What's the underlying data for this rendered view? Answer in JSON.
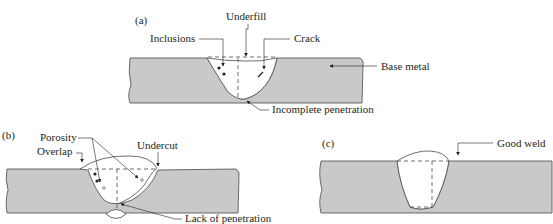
{
  "figure": {
    "colors": {
      "base_metal": "#c9c9c9",
      "outline": "#4a4a4a",
      "weld": "#ffffff",
      "text": "#231f20"
    },
    "panel_a": {
      "tag": "(a)",
      "labels": {
        "underfill": "Underfill",
        "inclusions": "Inclusions",
        "crack": "Crack",
        "base_metal": "Base metal",
        "incomplete_penetration": "Incomplete penetration"
      }
    },
    "panel_b": {
      "tag": "(b)",
      "labels": {
        "porosity": "Porosity",
        "overlap": "Overlap",
        "undercut": "Undercut",
        "lack_of_penetration": "Lack of penetration"
      }
    },
    "panel_c": {
      "tag": "(c)",
      "labels": {
        "good_weld": "Good weld"
      }
    }
  }
}
